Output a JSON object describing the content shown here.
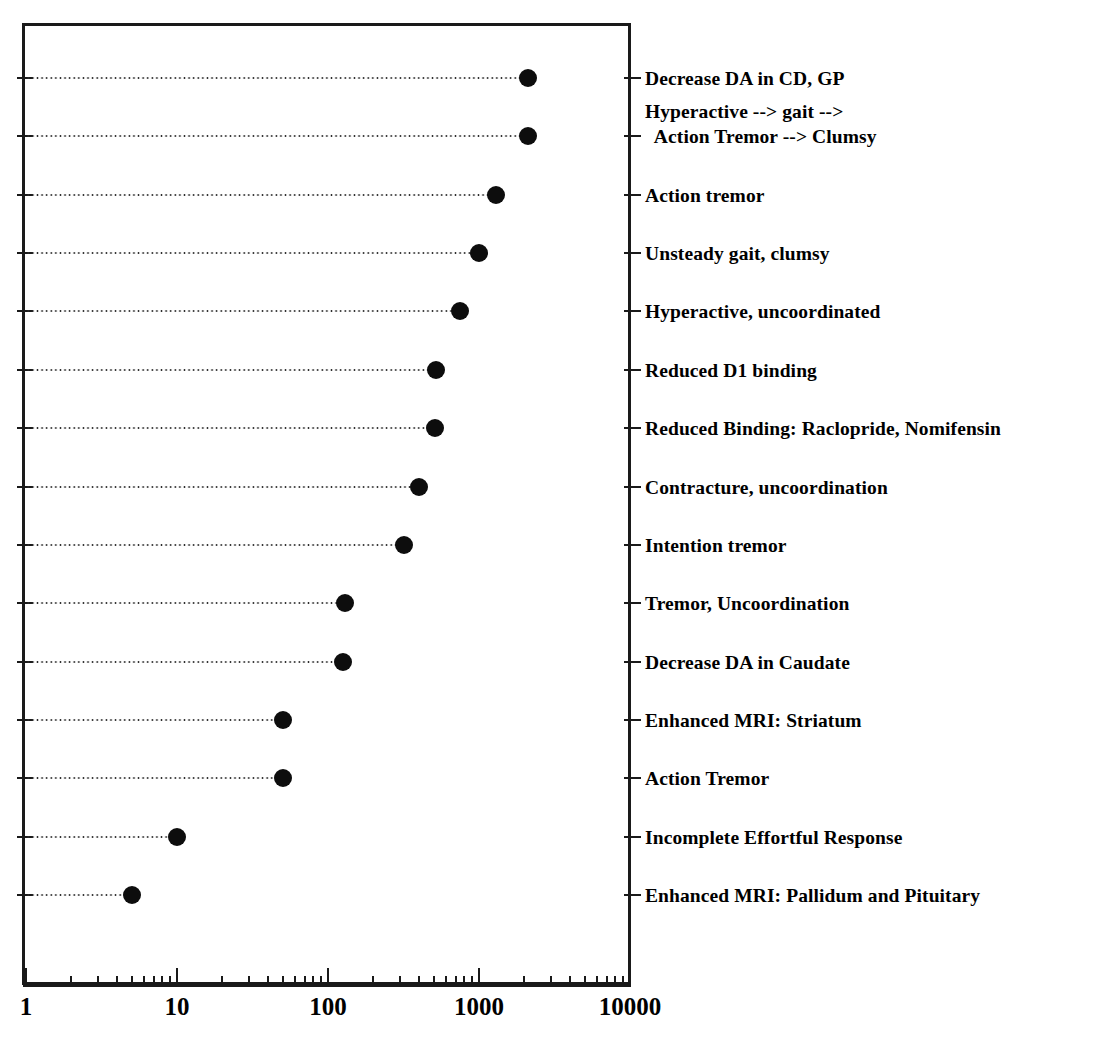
{
  "chart_data": {
    "type": "bar",
    "orientation": "horizontal",
    "subtype": "dot-plot",
    "title": "",
    "subtitle": "",
    "xlabel": "",
    "ylabel": "",
    "xscale": "log",
    "xlim": [
      1,
      10000
    ],
    "grid": false,
    "legend": null,
    "axis": {
      "tick_labels": [
        "1",
        "10",
        "100",
        "1000",
        "10000"
      ],
      "tick_values": [
        1,
        10,
        100,
        1000,
        10000
      ],
      "minor_ticks": true
    },
    "marker": {
      "shape": "circle",
      "filled": true,
      "color": "#0d0d0d"
    },
    "leader_line": "dotted",
    "categories": [
      "Decrease DA in CD, GP",
      "Hyperactive --> gait -->\n  Action Tremor --> Clumsy",
      "Action tremor",
      "Unsteady gait, clumsy",
      "Hyperactive, uncoordinated",
      "Reduced D1 binding",
      "Reduced Binding: Raclopride, Nomifensin",
      "Contracture, uncoordination",
      "Intention tremor",
      "Tremor, Uncoordination",
      "Decrease DA in Caudate",
      "Enhanced MRI: Striatum",
      "Action Tremor",
      "Incomplete Effortful Response",
      "Enhanced MRI: Pallidum and Pituitary"
    ],
    "values": [
      2100,
      2100,
      1300,
      1000,
      750,
      520,
      510,
      400,
      320,
      130,
      125,
      50,
      50,
      10,
      5
    ]
  },
  "rows": [
    {
      "label": "Decrease DA in CD, GP",
      "value": 2100,
      "two_line": false
    },
    {
      "label": "Hyperactive --> gait -->\n  Action Tremor --> Clumsy",
      "value": 2100,
      "two_line": true
    },
    {
      "label": "Action tremor",
      "value": 1300,
      "two_line": false
    },
    {
      "label": "Unsteady gait, clumsy",
      "value": 1000,
      "two_line": false
    },
    {
      "label": "Hyperactive, uncoordinated",
      "value": 750,
      "two_line": false
    },
    {
      "label": "Reduced D1 binding",
      "value": 520,
      "two_line": false
    },
    {
      "label": "Reduced Binding: Raclopride, Nomifensin",
      "value": 510,
      "two_line": false
    },
    {
      "label": "Contracture, uncoordination",
      "value": 400,
      "two_line": false
    },
    {
      "label": "Intention tremor",
      "value": 320,
      "two_line": false
    },
    {
      "label": "Tremor, Uncoordination",
      "value": 130,
      "two_line": false
    },
    {
      "label": "Decrease DA in Caudate",
      "value": 125,
      "two_line": false
    },
    {
      "label": "Enhanced MRI: Striatum",
      "value": 50,
      "two_line": false
    },
    {
      "label": "Action Tremor",
      "value": 50,
      "two_line": false
    },
    {
      "label": "Incomplete Effortful Response",
      "value": 10,
      "two_line": false
    },
    {
      "label": "Enhanced MRI: Pallidum and Pituitary",
      "value": 5,
      "two_line": false
    }
  ],
  "axis_labels": [
    {
      "text": "1",
      "value": 1
    },
    {
      "text": "10",
      "value": 10
    },
    {
      "text": "100",
      "value": 100
    },
    {
      "text": "1000",
      "value": 1000
    },
    {
      "text": "10000",
      "value": 10000
    }
  ]
}
